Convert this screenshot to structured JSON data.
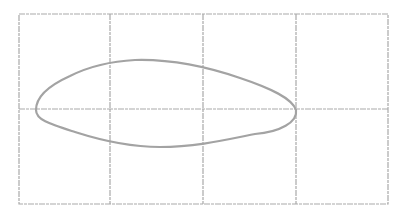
{
  "diagram": {
    "type": "sketch-grid-with-closed-curve",
    "grid": {
      "columns": 4,
      "rows": 2,
      "left": 19,
      "top": 14,
      "right": 388,
      "bottom": 204,
      "vertical_lines": [
        19,
        110,
        203,
        296,
        388
      ],
      "horizontal_lines": [
        14,
        109,
        204
      ],
      "color": "#a9a9a9"
    },
    "curve": {
      "shape": "airfoil-like closed loop",
      "color": "#a3a3a3",
      "path": "M 36 110 C 36 96, 50 85, 70 76 C 90 66, 115 61, 135 60 C 170 59, 205 66, 240 78 C 270 88, 292 98, 296 110 C 298 122, 280 132, 255 134 C 225 140, 195 147, 160 147 C 130 147, 100 140, 75 132 C 50 124, 36 120, 36 110 Z"
    }
  }
}
